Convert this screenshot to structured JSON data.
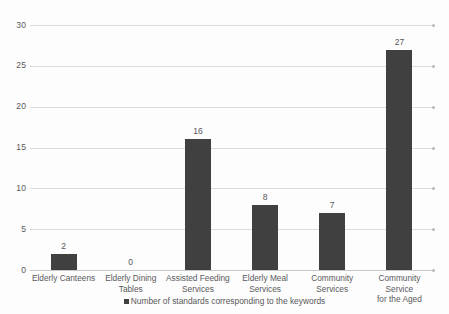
{
  "chart_data": {
    "type": "bar",
    "title": "",
    "subtitle": "",
    "xlabel": "",
    "ylabel": "",
    "categories": [
      "Elderly Canteens",
      "Elderly Dining Tables",
      "Assisted Feeding Services",
      "Elderly Meal Services",
      "Community Services",
      "Community Service for the Aged"
    ],
    "category_lines": [
      [
        "Elderly Canteens"
      ],
      [
        "Elderly Dining",
        "Tables"
      ],
      [
        "Assisted Feeding",
        "Services"
      ],
      [
        "Elderly Meal",
        "Services"
      ],
      [
        "Community",
        "Services"
      ],
      [
        "Community Service",
        "for the Aged"
      ]
    ],
    "values": [
      2,
      0,
      16,
      8,
      7,
      27
    ],
    "data_labels": [
      "2",
      "0",
      "16",
      "8",
      "7",
      "27"
    ],
    "series": [
      {
        "name": "Number of standards corresponding to the keywords",
        "values": [
          2,
          0,
          16,
          8,
          7,
          27
        ]
      }
    ],
    "ylim": [
      0,
      30
    ],
    "ytick_values": [
      0,
      5,
      10,
      15,
      20,
      25,
      30
    ],
    "ytick_labels": [
      "0",
      "5",
      "10",
      "15",
      "20",
      "25",
      "30"
    ],
    "grid": true,
    "grid_axis": "y",
    "legend_position": "bottom",
    "bar_color": "#404040",
    "grid_color": "#dcdcdc",
    "axis_text_color": "#59595b",
    "background_color": "#fdfdfd"
  },
  "legend": {
    "entries": [
      {
        "label": "Number of standards corresponding to the keywords",
        "color": "#404040"
      }
    ]
  }
}
